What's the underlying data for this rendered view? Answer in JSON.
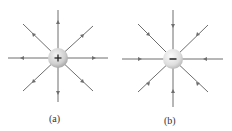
{
  "diagrams": [
    {
      "id": "a",
      "caption": "(a)",
      "charge_sign": "+",
      "field_direction": "outward",
      "center": [
        58,
        58
      ]
    },
    {
      "id": "b",
      "caption": "(b)",
      "charge_sign": "−",
      "field_direction": "inward",
      "center": [
        173,
        59
      ]
    }
  ],
  "colors": {
    "line": "#6e6e6e",
    "charge_fill": "#d8d8d8",
    "sign": "#222222"
  }
}
